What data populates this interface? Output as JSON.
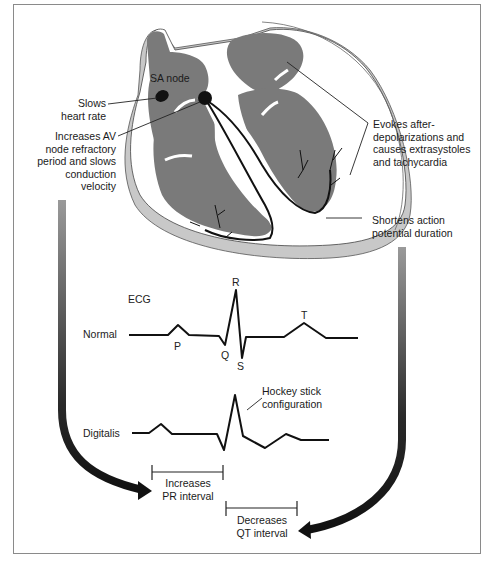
{
  "heart_labels": {
    "sa_node": "SA node",
    "slows_heart_rate": [
      "Slows",
      "heart rate"
    ],
    "av_node": [
      "Increases AV",
      "node refractory",
      "period and slows",
      "conduction",
      "velocity"
    ],
    "evokes": [
      "Evokes after-",
      "depolarizations and",
      "causes extrasystoles",
      "and tachycardia"
    ],
    "shortens": [
      "Shortens action",
      "potential duration"
    ]
  },
  "ecg": {
    "title": "ECG",
    "normal_label": "Normal",
    "digitalis_label": "Digitalis",
    "waves": {
      "p": "P",
      "q": "Q",
      "r": "R",
      "s": "S",
      "t": "T"
    },
    "hockey_stick": [
      "Hockey stick",
      "configuration"
    ]
  },
  "intervals": {
    "pr": [
      "Increases",
      "PR interval"
    ],
    "qt": [
      "Decreases",
      "QT interval"
    ]
  },
  "colors": {
    "myocardium": "#7a7a7a",
    "pericardium": "#c8c8c8",
    "line": "#111111",
    "frame": "#8a8a8a"
  }
}
